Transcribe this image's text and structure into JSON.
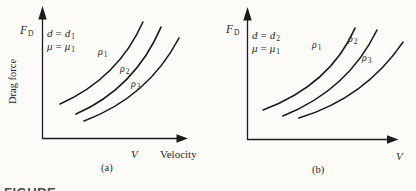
{
  "figure_type": "textbook dual-panel qualitative plot, drag force vs velocity",
  "caption": {
    "text_partial": "FIGURE"
  },
  "panel_a": {
    "fd": {
      "sym": "F",
      "sub": "D"
    },
    "drag_force_label": "Drag force",
    "param1": {
      "lhs": "d",
      "eq": "=",
      "rhs": "d",
      "sub": "1"
    },
    "param2": {
      "lhs": "μ",
      "eq": "=",
      "rhs": "μ",
      "sub": "1"
    },
    "rho1": {
      "sym": "ρ",
      "sub": "1"
    },
    "rho2": {
      "sym": "ρ",
      "sub": "2"
    },
    "rho3": {
      "sym": "ρ",
      "sub": "3"
    },
    "x_var": "V",
    "x_name": "Velocity",
    "panel_label": "(a)"
  },
  "panel_b": {
    "fd": {
      "sym": "F",
      "sub": "D"
    },
    "param1": {
      "lhs": "d",
      "eq": "=",
      "rhs": "d",
      "sub": "2"
    },
    "param2": {
      "lhs": "μ",
      "eq": "=",
      "rhs": "μ",
      "sub": "1"
    },
    "rho1": {
      "sym": "ρ",
      "sub": "1"
    },
    "rho2": {
      "sym": "ρ",
      "sub": "2"
    },
    "rho3": {
      "sym": "ρ",
      "sub": "3"
    },
    "x_var": "V",
    "panel_label": "(b)"
  },
  "chart_data": [
    {
      "type": "line",
      "panel": "(a)",
      "title": "",
      "xlabel": "V (Velocity)",
      "ylabel": "F_D (Drag force)",
      "conditions": [
        "d = d1",
        "μ = μ1"
      ],
      "qualitative": true,
      "axes": {
        "ticks": "none",
        "grid": false,
        "style": "arrow-ended axes, no scale"
      },
      "legend": "curve labels inline: ρ1 (upper/left), ρ2 (middle), ρ3 (lower/right)",
      "series": [
        {
          "name": "ρ1",
          "shape": "concave-up increasing",
          "bezier_norm": [
            0.122,
            0.265,
            0.514,
            0.462,
            0.682,
            0.886
          ]
        },
        {
          "name": "ρ2",
          "shape": "concave-up increasing",
          "bezier_norm": [
            0.23,
            0.189,
            0.628,
            0.386,
            0.804,
            0.848
          ]
        },
        {
          "name": "ρ3",
          "shape": "concave-up increasing",
          "bezier_norm": [
            0.284,
            0.136,
            0.716,
            0.318,
            0.926,
            0.765
          ]
        }
      ]
    },
    {
      "type": "line",
      "panel": "(b)",
      "title": "",
      "xlabel": "V",
      "ylabel": "F_D",
      "conditions": [
        "d = d2",
        "μ = μ1"
      ],
      "qualitative": true,
      "axes": {
        "ticks": "none",
        "grid": false,
        "style": "arrow-ended axes, no scale"
      },
      "legend": "curve labels inline: ρ1 (upper/left), ρ2 (middle), ρ3 (lower/right)",
      "series": [
        {
          "name": "ρ1",
          "shape": "concave-up increasing, steeper than panel a",
          "bezier_norm": [
            0.106,
            0.227,
            0.55,
            0.417,
            0.715,
            0.848
          ]
        },
        {
          "name": "ρ2",
          "shape": "concave-up increasing",
          "bezier_norm": [
            0.238,
            0.182,
            0.669,
            0.379,
            0.861,
            0.833
          ]
        },
        {
          "name": "ρ3",
          "shape": "concave-up increasing",
          "bezier_norm": [
            0.344,
            0.167,
            0.781,
            0.318,
            1.033,
            0.742
          ]
        }
      ]
    }
  ],
  "colors": {
    "ink": "#1a1a1a",
    "background": "#fcfbf8"
  }
}
